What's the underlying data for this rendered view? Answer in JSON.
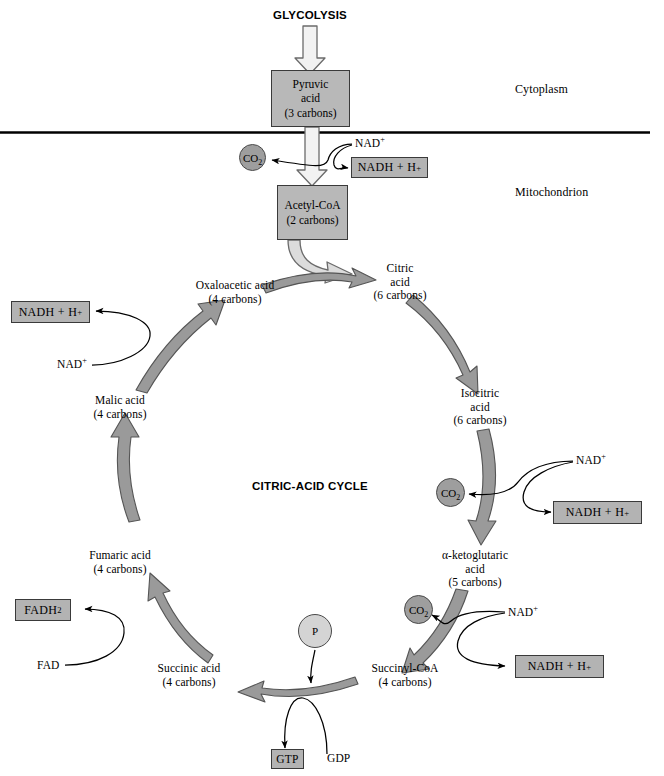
{
  "figure": {
    "center_label": "CITRIC-ACID CYCLE",
    "entry_label": "GLYCOLYSIS"
  },
  "compartments": {
    "upper": "Cytoplasm",
    "lower": "Mitochondrion",
    "membrane_color": "#000000"
  },
  "colors": {
    "box_fill": "#b8b8b8",
    "box_stroke": "#3a3a3a",
    "arrow_fill": "#9a9a9a",
    "arrow_stroke": "#555555",
    "pale_arrow_fill": "#cfcfcf",
    "co2_fill": "#9e9e9e",
    "phosphate_fill": "#d4d4d4",
    "text": "#000000"
  },
  "metabolite_boxes": [
    {
      "id": "pyruvic",
      "name": "Pyruvic acid",
      "line1": "Pyruvic",
      "line2": "acid",
      "carbons": "(3 carbons)"
    },
    {
      "id": "acetylcoa",
      "name": "Acetyl-CoA",
      "line1": "Acetyl-CoA",
      "line2": "",
      "carbons": "(2 carbons)"
    }
  ],
  "cycle_intermediates": [
    {
      "id": "citric",
      "line1": "Citric",
      "line2": "acid",
      "carbons": "(6 carbons)"
    },
    {
      "id": "isocitric",
      "line1": "Isocitric",
      "line2": "acid",
      "carbons": "(6 carbons)"
    },
    {
      "id": "ketoglutaric",
      "line1": "α-ketoglutaric",
      "line2": "acid",
      "carbons": "(5 carbons)"
    },
    {
      "id": "succinylcoa",
      "line1": "Succinyl-CoA",
      "line2": "",
      "carbons": "(4 carbons)"
    },
    {
      "id": "succinic",
      "line1": "Succinic acid",
      "line2": "",
      "carbons": "(4 carbons)"
    },
    {
      "id": "fumaric",
      "line1": "Fumaric acid",
      "line2": "",
      "carbons": "(4 carbons)"
    },
    {
      "id": "malic",
      "line1": "Malic acid",
      "line2": "",
      "carbons": "(4 carbons)"
    },
    {
      "id": "oxaloacetic",
      "line1": "Oxaloacetic acid",
      "line2": "",
      "carbons": "(4 carbons)"
    }
  ],
  "co2_nodes": [
    {
      "id": "co2-pdh",
      "label": "CO2"
    },
    {
      "id": "co2-idh",
      "label": "CO2"
    },
    {
      "id": "co2-kgdh",
      "label": "CO2"
    }
  ],
  "cofactors": {
    "nad_plus": "NAD",
    "nad_plus_sup": "+",
    "nadh": "NADH + H",
    "nadh_sup": "+",
    "fad": "FAD",
    "fadh2": "FADH",
    "fadh2_sub": "2",
    "gtp": "GTP",
    "gdp": "GDP",
    "phosphate": "P"
  },
  "nad_inputs": [
    {
      "id": "nad-pdh"
    },
    {
      "id": "nad-mdh"
    },
    {
      "id": "nad-idh"
    },
    {
      "id": "nad-kgdh"
    }
  ],
  "nadh_outputs": [
    {
      "id": "nadh-pdh"
    },
    {
      "id": "nadh-mdh"
    },
    {
      "id": "nadh-idh"
    },
    {
      "id": "nadh-kgdh"
    }
  ]
}
